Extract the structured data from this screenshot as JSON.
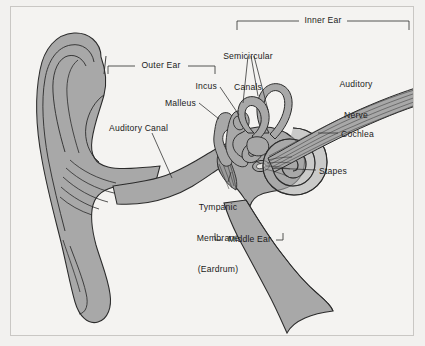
{
  "figure": {
    "type": "anatomical-diagram",
    "background_color": "#f4f3f1",
    "fill_color": "#a8a8a8",
    "outline_color": "#2b2b2b",
    "text_color": "#1b1b1b",
    "frame_color": "#c9c7c4"
  },
  "brackets": [
    {
      "id": "outer-ear",
      "label": "Outer Ear",
      "orientation": "ticks-down",
      "x1": 108,
      "x2": 215,
      "y": 66,
      "label_x": 161,
      "label_y": 61
    },
    {
      "id": "inner-ear",
      "label": "Inner Ear",
      "orientation": "ticks-down",
      "x1": 237,
      "x2": 409,
      "y": 21,
      "label_x": 323,
      "label_y": 16
    },
    {
      "id": "middle-ear",
      "label": "Middle Ear",
      "orientation": "ticks-up",
      "x1": 215,
      "x2": 283,
      "y": 240,
      "label_x": 249,
      "label_y": 235
    }
  ],
  "labels": [
    {
      "id": "semicircular-canals",
      "text": "Semicircular\nCanals",
      "line1": "Semicircular",
      "line2": "Canals",
      "x": 248,
      "y": 40,
      "align": "center"
    },
    {
      "id": "auditory-nerve",
      "text": "Auditory\nNerve",
      "line1": "Auditory",
      "line2": "Nerve",
      "x": 356,
      "y": 63,
      "align": "center"
    },
    {
      "id": "incus",
      "text": "Incus",
      "x": 217,
      "y": 86,
      "align": "right"
    },
    {
      "id": "malleus",
      "text": "Malleus",
      "x": 196,
      "y": 103,
      "align": "right"
    },
    {
      "id": "auditory-canal",
      "text": "Auditory Canal",
      "x": 109,
      "y": 128,
      "align": "left"
    },
    {
      "id": "cochlea",
      "text": "Cochlea",
      "x": 340,
      "y": 134,
      "align": "left"
    },
    {
      "id": "stapes",
      "text": "Stapes",
      "x": 318,
      "y": 171,
      "align": "left"
    },
    {
      "id": "tympanic-membrane",
      "text": "Tympanic\nMembrane\n(Eardrum)",
      "line1": "Tympanic",
      "line2": "Membrane",
      "line3": "(Eardrum)",
      "x": 218,
      "y": 186,
      "align": "center"
    }
  ]
}
